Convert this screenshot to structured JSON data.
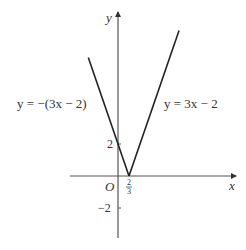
{
  "diagram": {
    "title": "",
    "axes": {
      "x_label": "x",
      "y_label": "y",
      "origin_label": "O",
      "y_ticks": [
        {
          "value": 2,
          "label": "2"
        },
        {
          "value": -2,
          "label": "−2"
        }
      ],
      "x_ticks": [
        {
          "value": 0.6667,
          "numerator": "2",
          "denominator": "3"
        }
      ]
    },
    "curves": [
      {
        "name": "left-branch",
        "equation_label": "y = −(3x − 2)",
        "slope": -3,
        "intercept": 2,
        "x_range": [
          -1.8,
          0.6667
        ]
      },
      {
        "name": "right-branch",
        "equation_label": "y = 3x − 2",
        "slope": 3,
        "intercept": -2,
        "x_range": [
          0.6667,
          3.7
        ]
      }
    ],
    "vertex": {
      "x": 0.6667,
      "y": 0
    }
  }
}
